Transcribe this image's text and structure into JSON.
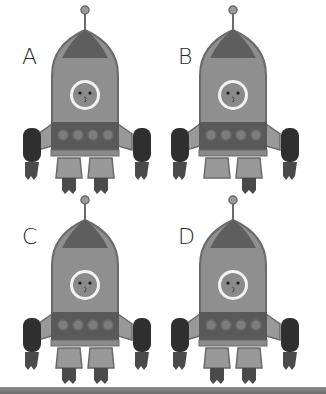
{
  "puzzle": {
    "type": "spot-the-difference",
    "options": [
      {
        "label": "A",
        "left_flame": true,
        "right_flame": true
      },
      {
        "label": "B",
        "left_flame": false,
        "right_flame": true
      },
      {
        "label": "C",
        "left_flame": true,
        "right_flame": true
      },
      {
        "label": "D",
        "left_flame": true,
        "right_flame": true
      }
    ]
  },
  "colors": {
    "background": "#ffffff",
    "body": "#8f8f8f",
    "body_outline": "#6a6a6a",
    "nose": "#5e5e5e",
    "band": "#595959",
    "portholes": "#7d7d7d",
    "boosters": "#2f2f2f",
    "flames": "#4a4a4a",
    "face": "#8a8a8a",
    "window_ring": "#f2f2f2",
    "label_text": "#2a2a2a",
    "bottom_bar": "#7a7a7a"
  }
}
